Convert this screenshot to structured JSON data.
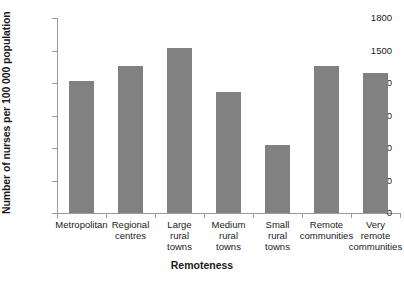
{
  "page": {
    "top_cropped_text": "",
    "bottom_cropped_text": ""
  },
  "chart_data": {
    "type": "bar",
    "title": "",
    "xlabel": "Remoteness",
    "ylabel": "Number of nurses per 100 000 population",
    "categories": [
      "Metropolitan",
      "Regional\ncentres",
      "Large\nrural\ntowns",
      "Medium\nrural\ntowns",
      "Small\nrural\ntowns",
      "Remote\ncommunities",
      "Very\nremote\ncommunities"
    ],
    "category_lines": [
      [
        "Metropolitan"
      ],
      [
        "Regional",
        "centres"
      ],
      [
        "Large",
        "rural",
        "towns"
      ],
      [
        "Medium",
        "rural",
        "towns"
      ],
      [
        "Small",
        "rural",
        "towns"
      ],
      [
        "Remote",
        "communities"
      ],
      [
        "Very",
        "remote",
        "communities"
      ]
    ],
    "values": [
      1220,
      1360,
      1520,
      1120,
      630,
      1360,
      1290
    ],
    "ylim": [
      0,
      1800
    ],
    "yticks": [
      0,
      300,
      600,
      900,
      1200,
      1500,
      1800
    ],
    "ytick_labels": [
      "0",
      "300",
      "600",
      "900",
      "1200",
      "1500",
      "1800"
    ],
    "grid": false,
    "legend": null,
    "bar_color": "#818181",
    "axis_color": "#9a9a9a",
    "text_color": "#1a1a1a"
  }
}
